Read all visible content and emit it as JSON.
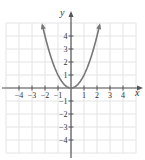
{
  "chart_data": {
    "type": "line",
    "title": "",
    "function": "y = x^2",
    "xlabel": "x",
    "ylabel": "y",
    "xlim": [
      -5,
      5
    ],
    "ylim": [
      -5,
      5
    ],
    "grid": true,
    "x_tick_labels": [
      "-4",
      "-3",
      "-2",
      "-1",
      "1",
      "2",
      "3",
      "4"
    ],
    "y_tick_labels": [
      "4",
      "3",
      "2",
      "1",
      "-1",
      "-2",
      "-3",
      "-4"
    ],
    "series": [
      {
        "name": "y = x^2",
        "x": [
          -2.2,
          -2,
          -1.5,
          -1,
          -0.5,
          0,
          0.5,
          1,
          1.5,
          2,
          2.2
        ],
        "values": [
          4.84,
          4,
          2.25,
          1,
          0.25,
          0,
          0.25,
          1,
          2.25,
          4,
          4.84
        ]
      }
    ],
    "colors": {
      "curve": "#777777",
      "axis": "#555555",
      "grid": "#e4e4e4"
    }
  }
}
